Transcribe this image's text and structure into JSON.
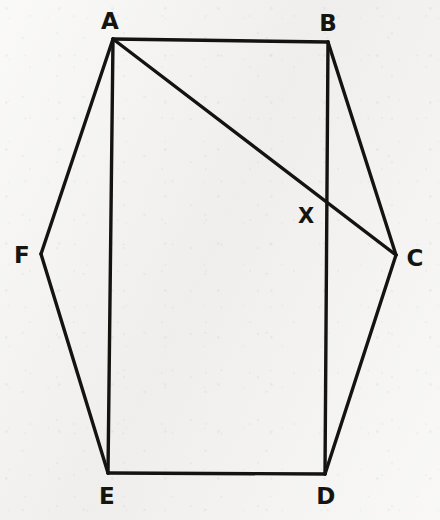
{
  "figure": {
    "background_color": "#f4f3f1",
    "stroke_color": "#151310",
    "stroke_width": 3.4,
    "canvas": {
      "width": 440,
      "height": 520
    }
  },
  "points": [
    {
      "id": "A",
      "label": "A",
      "x": 113,
      "y": 39,
      "label_x": 110,
      "label_y": 21,
      "kind": "vertex"
    },
    {
      "id": "B",
      "label": "B",
      "x": 328,
      "y": 42,
      "label_x": 328,
      "label_y": 23,
      "kind": "vertex"
    },
    {
      "id": "C",
      "label": "C",
      "x": 396,
      "y": 255,
      "label_x": 415,
      "label_y": 258,
      "kind": "vertex"
    },
    {
      "id": "D",
      "label": "D",
      "x": 325,
      "y": 474,
      "label_x": 326,
      "label_y": 496,
      "kind": "vertex"
    },
    {
      "id": "E",
      "label": "E",
      "x": 108,
      "y": 473,
      "label_x": 107,
      "label_y": 496,
      "kind": "vertex"
    },
    {
      "id": "F",
      "label": "F",
      "x": 41,
      "y": 254,
      "label_x": 22,
      "label_y": 255,
      "kind": "vertex"
    },
    {
      "id": "X",
      "label": "X",
      "x": 326,
      "y": 199,
      "label_x": 306,
      "label_y": 216,
      "kind": "intersection"
    }
  ],
  "segments": [
    {
      "id": "AB",
      "from": "A",
      "to": "B",
      "role": "hexagon-side",
      "x1": 113,
      "y1": 39,
      "x2": 328,
      "y2": 42
    },
    {
      "id": "BC",
      "from": "B",
      "to": "C",
      "role": "hexagon-side",
      "x1": 328,
      "y1": 42,
      "x2": 396,
      "y2": 255
    },
    {
      "id": "CD",
      "from": "C",
      "to": "D",
      "role": "hexagon-side",
      "x1": 396,
      "y1": 255,
      "x2": 325,
      "y2": 474
    },
    {
      "id": "DE",
      "from": "D",
      "to": "E",
      "role": "hexagon-side",
      "x1": 325,
      "y1": 474,
      "x2": 108,
      "y2": 473
    },
    {
      "id": "EF",
      "from": "E",
      "to": "F",
      "role": "hexagon-side",
      "x1": 108,
      "y1": 473,
      "x2": 41,
      "y2": 254
    },
    {
      "id": "FA",
      "from": "F",
      "to": "A",
      "role": "hexagon-side",
      "x1": 41,
      "y1": 254,
      "x2": 113,
      "y2": 39
    },
    {
      "id": "AE",
      "from": "A",
      "to": "E",
      "role": "chord",
      "x1": 113,
      "y1": 39,
      "x2": 108,
      "y2": 473
    },
    {
      "id": "BD",
      "from": "B",
      "to": "D",
      "role": "chord",
      "x1": 328,
      "y1": 42,
      "x2": 325,
      "y2": 474
    },
    {
      "id": "AC",
      "from": "A",
      "to": "C",
      "role": "diagonal",
      "x1": 113,
      "y1": 39,
      "x2": 396,
      "y2": 255
    }
  ]
}
